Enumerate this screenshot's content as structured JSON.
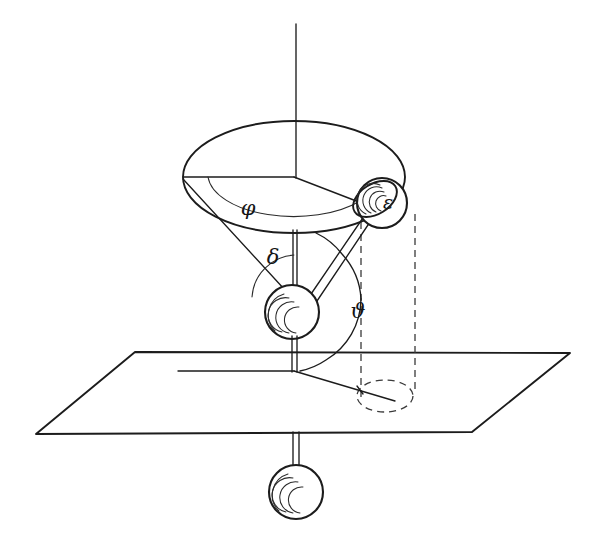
{
  "figure": {
    "background_color": "#ffffff",
    "ink_color": "#1c1c1c",
    "dashed_color": "#3a3a3a",
    "width": 605,
    "height": 545
  },
  "labels": {
    "phi": "φ",
    "delta": "δ",
    "theta": "ϑ",
    "epsilon": "ε"
  },
  "annotations": [
    {
      "name": "azimuth-angle-phi",
      "symbol": "φ",
      "x": 248,
      "y": 209,
      "description": "azimuth angle on the upper circular disc"
    },
    {
      "name": "cone-half-angle-delta",
      "symbol": "δ",
      "x": 273,
      "y": 258,
      "description": "half angle of the cone at the middle pivot ball"
    },
    {
      "name": "polar-angle-theta",
      "symbol": "ϑ",
      "x": 358,
      "y": 312,
      "description": "polar angle measured to the vertical dashed line"
    },
    {
      "name": "epsilon-mark",
      "symbol": "ε",
      "x": 385,
      "y": 202,
      "description": "epsilon mark on the outer orbiting ball"
    }
  ],
  "elements": {
    "vertical_axis": {
      "name": "vertical-axis",
      "x": 296,
      "y_top": 24,
      "y_bottom": 178
    },
    "upper_disc": {
      "name": "upper-disc-ellipse",
      "cx": 294,
      "cy": 177,
      "rx": 111,
      "ry": 56
    },
    "phi_arc": {
      "name": "phi-angle-arc",
      "radius": 86
    },
    "disc_radius_left": {
      "name": "disc-radius-left",
      "x1": 294,
      "y1": 177,
      "x2": 183,
      "y2": 177
    },
    "disc_radius_right": {
      "name": "disc-radius-to-ball",
      "x1": 294,
      "y1": 177,
      "x2": 375,
      "y2": 208
    },
    "center_post": {
      "name": "center-post",
      "x": 294,
      "y1": 230,
      "y2": 295
    },
    "middle_ball": {
      "name": "middle-pivot-ball",
      "cx": 292,
      "cy": 312,
      "r": 27
    },
    "upper_ball": {
      "name": "orbiting-ball",
      "cx": 382,
      "cy": 203,
      "r": 25
    },
    "lower_ball": {
      "name": "lower-counterweight-ball",
      "cx": 296,
      "cy": 492,
      "r": 27
    },
    "cone_line_left": {
      "name": "cone-generator-left",
      "x1": 284,
      "y1": 288,
      "x2": 183,
      "y2": 180
    },
    "rod_to_ball": {
      "name": "rigid-rod-to-orbiting-ball",
      "x1": 310,
      "y1": 300,
      "x2": 368,
      "y2": 214
    },
    "plane": {
      "name": "reference-plane",
      "points": "135,352 570,353 472,432 36,434"
    },
    "plane_axis_line": {
      "name": "plane-reference-line",
      "x1": 178,
      "y1": 371,
      "x2": 294,
      "y2": 371
    },
    "plane_radius_line": {
      "name": "plane-projection-radius",
      "x1": 294,
      "y1": 371,
      "x2": 392,
      "y2": 400
    },
    "projection_ellipse": {
      "name": "projection-circle-dashed",
      "cx": 385,
      "cy": 396,
      "rx": 28,
      "ry": 16
    },
    "dashed_drop_left": {
      "name": "dashed-drop-line-left",
      "x": 361,
      "y1": 222,
      "y2": 398
    },
    "dashed_drop_right": {
      "name": "dashed-drop-line-right",
      "x": 415,
      "y1": 214,
      "y2": 392
    },
    "lower_post": {
      "name": "lower-post",
      "x": 296,
      "y1": 434,
      "y2": 466
    },
    "theta_arc": {
      "name": "theta-angle-arc",
      "radius": 72
    },
    "delta_arc": {
      "name": "delta-angle-arc",
      "radius": 45
    }
  }
}
